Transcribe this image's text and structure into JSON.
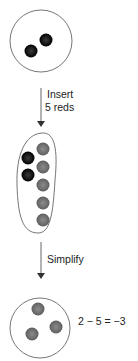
{
  "diagram": {
    "step1": {
      "label_line1": "Insert",
      "label_line2": "5 reds"
    },
    "step2": {
      "label": "Simplify"
    },
    "result": {
      "equation": "2 − 5 = −3"
    },
    "colors": {
      "black_chip": "#1a1a1a",
      "red_chip": "#7a7a7a",
      "outline": "#555555",
      "arrow": "#444444"
    },
    "counts": {
      "initial_black": 2,
      "inserted_red": 5,
      "final_red": 3
    }
  }
}
